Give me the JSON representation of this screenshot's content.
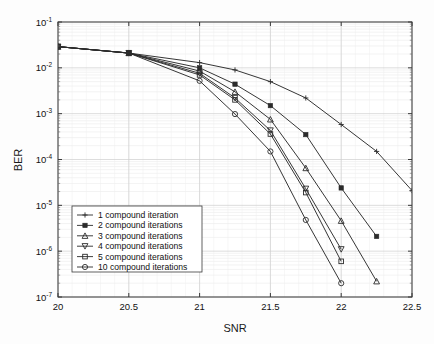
{
  "figure": {
    "title": "",
    "background_color": "#fdfdfd",
    "axes_color": "#3a3a3a",
    "grid_color": "#d9d9d9",
    "line_color": "#2b2b2b"
  },
  "axes": {
    "x_label": "SNR",
    "y_label": "BER",
    "x_ticks": [
      "20",
      "20.5",
      "21",
      "21.5",
      "22",
      "22.5"
    ],
    "y_ticks": [
      "10-1",
      "10-2",
      "10-3",
      "10-4",
      "10-5",
      "10-6",
      "10-7"
    ],
    "y_tick_mantissa": "10",
    "y_tick_exponents": [
      "-1",
      "-2",
      "-3",
      "-4",
      "-5",
      "-6",
      "-7"
    ]
  },
  "legend": {
    "items": [
      {
        "label": "1 compound iteration",
        "marker": "plus-marker"
      },
      {
        "label": "2 compound iterations",
        "marker": "filled-square-marker"
      },
      {
        "label": "3 compound iterations",
        "marker": "triangle-up-marker"
      },
      {
        "label": "4 compound iterations",
        "marker": "triangle-down-marker"
      },
      {
        "label": "5 compound iterations",
        "marker": "open-square-marker"
      },
      {
        "label": "10 compound iterations",
        "marker": "open-circle-marker"
      }
    ]
  },
  "chart_data": {
    "type": "line",
    "title": "",
    "xlabel": "SNR",
    "ylabel": "BER",
    "xlim": [
      20,
      22.5
    ],
    "ylim": [
      1e-07,
      0.1
    ],
    "yscale": "log",
    "grid": true,
    "legend_position": "lower-left",
    "x_ticks": [
      20,
      20.5,
      21,
      21.5,
      22,
      22.5
    ],
    "y_ticks": [
      0.1,
      0.01,
      0.001,
      0.0001,
      1e-05,
      1e-06,
      1e-07
    ],
    "series": [
      {
        "name": "1 compound iteration",
        "marker": "plus",
        "x": [
          20,
          20.5,
          21,
          21.25,
          21.5,
          21.75,
          22,
          22.25,
          22.5
        ],
        "y": [
          0.029,
          0.021,
          0.013,
          0.009,
          0.005,
          0.0022,
          0.00058,
          0.00015,
          2.1e-05
        ]
      },
      {
        "name": "2 compound iterations",
        "marker": "filled-square",
        "x": [
          20,
          20.5,
          21,
          21.25,
          21.5,
          21.75,
          22,
          22.25
        ],
        "y": [
          0.029,
          0.021,
          0.01,
          0.0044,
          0.0015,
          0.00035,
          2.4e-05,
          2.1e-06
        ]
      },
      {
        "name": "3 compound iterations",
        "marker": "triangle-up",
        "x": [
          20,
          20.5,
          21,
          21.25,
          21.5,
          21.75,
          22,
          22.25
        ],
        "y": [
          0.029,
          0.021,
          0.0085,
          0.003,
          0.00075,
          6.5e-05,
          4.6e-06,
          2.2e-07
        ]
      },
      {
        "name": "4 compound iterations",
        "marker": "triangle-down",
        "x": [
          20,
          20.5,
          21,
          21.25,
          21.5,
          21.75,
          22
        ],
        "y": [
          0.029,
          0.021,
          0.0076,
          0.0022,
          0.00043,
          2.3e-05,
          1.1e-06
        ]
      },
      {
        "name": "5 compound iterations",
        "marker": "open-square",
        "x": [
          20,
          20.5,
          21,
          21.25,
          21.5,
          21.75,
          22
        ],
        "y": [
          0.029,
          0.021,
          0.007,
          0.002,
          0.00036,
          1.9e-05,
          6e-07
        ]
      },
      {
        "name": "10 compound iterations",
        "marker": "open-circle",
        "x": [
          20,
          20.5,
          21,
          21.25,
          21.5,
          21.75,
          22
        ],
        "y": [
          0.029,
          0.021,
          0.0052,
          0.00098,
          0.00015,
          4.8e-06,
          2e-07
        ]
      }
    ]
  }
}
